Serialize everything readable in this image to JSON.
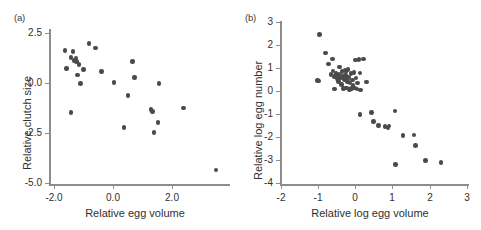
{
  "figure": {
    "background": "#ffffff",
    "dot_color": "#4a4a4a",
    "axis_color": "#8d8d8d",
    "text_color": "#2f2f2f"
  },
  "chart_data": [
    {
      "type": "scatter",
      "panel_label": "(a)",
      "title": "",
      "xlabel": "Relative egg volume",
      "ylabel": "Relative clutch size",
      "xlim": [
        -2.0,
        3.9
      ],
      "ylim": [
        -5.0,
        3.3
      ],
      "xticks": [
        -2.0,
        0.0,
        2.0
      ],
      "xticklabels": [
        "-2.0",
        "0.0",
        "2.0"
      ],
      "yticks": [
        2.5,
        0.0,
        -2.5,
        -5.0
      ],
      "yticklabels": [
        "2.5",
        "0.0",
        "-2.5",
        "-5.0"
      ],
      "grid": false,
      "legend": "none",
      "points": [
        [
          -1.48,
          1.68
        ],
        [
          -1.42,
          0.78
        ],
        [
          -1.28,
          1.32
        ],
        [
          -1.22,
          1.62
        ],
        [
          -1.18,
          1.18
        ],
        [
          -1.12,
          1.3
        ],
        [
          -1.1,
          1.12
        ],
        [
          -1.08,
          0.45
        ],
        [
          -1.02,
          0.98
        ],
        [
          -0.98,
          0.02
        ],
        [
          -0.88,
          0.72
        ],
        [
          -0.7,
          2.02
        ],
        [
          -0.48,
          1.8
        ],
        [
          -0.28,
          0.62
        ],
        [
          -1.28,
          -1.42
        ],
        [
          0.12,
          0.08
        ],
        [
          0.45,
          -2.18
        ],
        [
          0.58,
          -0.58
        ],
        [
          0.72,
          1.12
        ],
        [
          0.78,
          0.32
        ],
        [
          1.32,
          -1.28
        ],
        [
          1.38,
          -1.38
        ],
        [
          1.42,
          -2.42
        ],
        [
          1.55,
          -1.92
        ],
        [
          1.58,
          0.02
        ],
        [
          2.38,
          -1.2
        ],
        [
          3.45,
          -4.3
        ]
      ]
    },
    {
      "type": "scatter",
      "panel_label": "(b)",
      "title": "",
      "xlabel": "Relative log egg volume",
      "ylabel": "Relative log egg number",
      "xlim": [
        -2,
        3
      ],
      "ylim": [
        -4,
        3
      ],
      "xticks": [
        -2,
        -1,
        0,
        1,
        2,
        3
      ],
      "xticklabels": [
        "-2",
        "-1",
        "0",
        "1",
        "2",
        "3"
      ],
      "yticks": [
        3,
        2,
        1,
        0,
        -1,
        -2,
        -3,
        -4
      ],
      "yticklabels": [
        "3",
        "2",
        "1",
        "0",
        "-1",
        "-2",
        "-3",
        "-4"
      ],
      "grid": false,
      "legend": "none",
      "points": [
        [
          -0.97,
          2.46
        ],
        [
          -1.02,
          0.47
        ],
        [
          -0.98,
          0.45
        ],
        [
          -0.8,
          1.66
        ],
        [
          -0.72,
          1.18
        ],
        [
          -0.66,
          0.72
        ],
        [
          -0.62,
          1.4
        ],
        [
          -0.6,
          0.88
        ],
        [
          -0.58,
          0.62
        ],
        [
          -0.56,
          0.1
        ],
        [
          -0.54,
          0.68
        ],
        [
          -0.52,
          0.78
        ],
        [
          -0.5,
          0.55
        ],
        [
          -0.48,
          0.66
        ],
        [
          -0.46,
          0.42
        ],
        [
          -0.44,
          0.72
        ],
        [
          -0.42,
          1.05
        ],
        [
          -0.4,
          0.58
        ],
        [
          -0.38,
          0.3
        ],
        [
          -0.36,
          0.86
        ],
        [
          -0.34,
          0.64
        ],
        [
          -0.32,
          0.12
        ],
        [
          -0.3,
          0.52
        ],
        [
          -0.28,
          0.92
        ],
        [
          -0.26,
          0.7
        ],
        [
          -0.25,
          0.85
        ],
        [
          -0.24,
          0.14
        ],
        [
          -0.22,
          0.44
        ],
        [
          -0.2,
          0.96
        ],
        [
          -0.18,
          0.6
        ],
        [
          -0.16,
          0.08
        ],
        [
          -0.14,
          0.36
        ],
        [
          -0.12,
          0.78
        ],
        [
          -0.1,
          0.12
        ],
        [
          -0.08,
          0.5
        ],
        [
          -0.06,
          0.26
        ],
        [
          -0.04,
          0.82
        ],
        [
          -0.02,
          0.14
        ],
        [
          0.0,
          1.36
        ],
        [
          0.02,
          0.58
        ],
        [
          0.04,
          0.1
        ],
        [
          0.06,
          0.36
        ],
        [
          0.1,
          1.38
        ],
        [
          0.12,
          0.8
        ],
        [
          0.14,
          0.06
        ],
        [
          0.22,
          1.4
        ],
        [
          0.3,
          0.4
        ],
        [
          0.12,
          -1.0
        ],
        [
          0.44,
          -0.92
        ],
        [
          0.48,
          -1.3
        ],
        [
          0.62,
          -1.46
        ],
        [
          0.8,
          -1.52
        ],
        [
          0.88,
          -1.58
        ],
        [
          0.9,
          -1.5
        ],
        [
          1.06,
          -0.84
        ],
        [
          1.08,
          -3.16
        ],
        [
          1.28,
          -1.9
        ],
        [
          1.58,
          -1.88
        ],
        [
          1.62,
          -2.34
        ],
        [
          1.88,
          -2.98
        ],
        [
          2.3,
          -3.08
        ]
      ]
    }
  ]
}
